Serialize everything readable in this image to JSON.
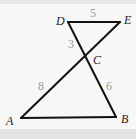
{
  "diagram": {
    "points": {
      "A": "A",
      "B": "B",
      "C": "C",
      "D": "D",
      "E": "E"
    },
    "segments": [
      {
        "from": "D",
        "to": "E",
        "length": "5"
      },
      {
        "from": "D",
        "to": "C",
        "length": "3"
      },
      {
        "from": "A",
        "to": "C",
        "length": "8"
      },
      {
        "from": "C",
        "to": "B",
        "length": "6"
      },
      {
        "from": "A",
        "to": "B",
        "length": ""
      },
      {
        "from": "C",
        "to": "E",
        "length": ""
      }
    ],
    "colors": {
      "line": "#111111",
      "point_label": "#222222",
      "length_label": "#9a9a9a"
    }
  }
}
